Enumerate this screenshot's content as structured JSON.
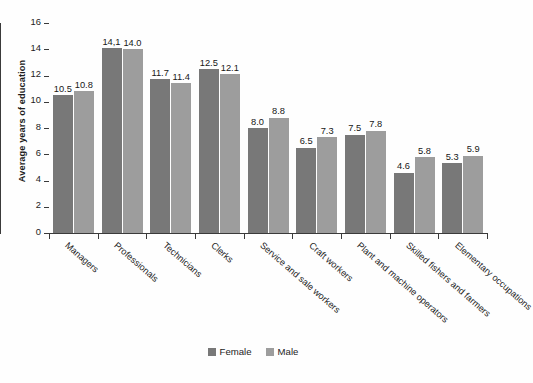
{
  "chart_data": {
    "type": "bar",
    "title": "",
    "subtitle": "",
    "xlabel": "",
    "ylabel": "Average years of education",
    "ylim": [
      0,
      16
    ],
    "ytick_step": 2,
    "yticks": [
      "16",
      "14",
      "12",
      "10",
      "8",
      "6",
      "4",
      "2",
      "0"
    ],
    "grid": false,
    "legend_position": "bottom-center",
    "categories": [
      "Managers",
      "Professionals",
      "Technicians",
      "Clerks",
      "Service and sale workers",
      "Craft workers",
      "Plant and machine operators",
      "Skilled fishers and farmers",
      "Elementary occupations"
    ],
    "series": [
      {
        "name": "Female",
        "color": "#787878",
        "values": [
          10.5,
          14.1,
          11.7,
          12.5,
          8.0,
          6.5,
          7.5,
          4.6,
          5.3
        ],
        "labels": [
          "10.5",
          "14,1",
          "11.7",
          "12.5",
          "8.0",
          "6.5",
          "7.5",
          "4.6",
          "5.3"
        ]
      },
      {
        "name": "Male",
        "color": "#9d9d9d",
        "values": [
          10.8,
          14.0,
          11.4,
          12.1,
          8.8,
          7.3,
          7.8,
          5.8,
          5.9
        ],
        "labels": [
          "10.8",
          "14.0",
          "11.4",
          "12.1",
          "8.8",
          "7.3",
          "7.8",
          "5.8",
          "5.9"
        ]
      }
    ]
  },
  "axis": {
    "y_title": "Average years of education"
  },
  "legend": {
    "items": [
      {
        "label": "Female",
        "color": "#787878"
      },
      {
        "label": "Male",
        "color": "#9d9d9d"
      }
    ]
  }
}
